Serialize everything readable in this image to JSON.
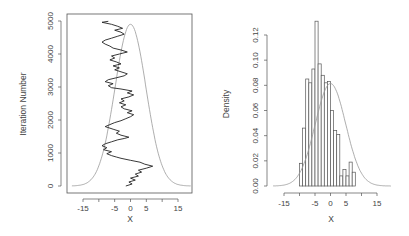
{
  "chart_data": [
    {
      "type": "line",
      "title": "",
      "xlabel": "X",
      "ylabel": "Iteration Number",
      "xlim": [
        -19,
        20
      ],
      "ylim": [
        -150,
        5150
      ],
      "x_ticks": [
        -15,
        -10,
        -5,
        0,
        5,
        10,
        15
      ],
      "x_tick_labels": [
        "-15",
        "",
        "-5",
        "0",
        "5",
        "",
        "15"
      ],
      "y_ticks": [
        0,
        1000,
        2000,
        3000,
        4000,
        5000
      ],
      "y_tick_labels": [
        "0",
        "1000",
        "2000",
        "3000",
        "4000",
        "5000"
      ],
      "grid": false,
      "series": [
        {
          "name": "trace",
          "color": "#222222",
          "points": [
            [
              -1.5,
              0
            ],
            [
              0.5,
              60
            ],
            [
              -0.5,
              120
            ],
            [
              1.5,
              180
            ],
            [
              0,
              240
            ],
            [
              2.5,
              300
            ],
            [
              1.5,
              360
            ],
            [
              3.5,
              420
            ],
            [
              2.5,
              480
            ],
            [
              5,
              540
            ],
            [
              7,
              600
            ],
            [
              4.5,
              660
            ],
            [
              3,
              720
            ],
            [
              0,
              780
            ],
            [
              -3,
              840
            ],
            [
              -4.5,
              880
            ],
            [
              -6,
              920
            ],
            [
              -7.5,
              980
            ],
            [
              -6,
              1040
            ],
            [
              -8.5,
              1100
            ],
            [
              -7.5,
              1160
            ],
            [
              -9,
              1220
            ],
            [
              -8,
              1280
            ],
            [
              -6,
              1340
            ],
            [
              -4,
              1400
            ],
            [
              -2,
              1440
            ],
            [
              -0.5,
              1480
            ],
            [
              -3,
              1540
            ],
            [
              -4.5,
              1600
            ],
            [
              -3.5,
              1660
            ],
            [
              -5.5,
              1720
            ],
            [
              -8,
              1800
            ],
            [
              -6.5,
              1860
            ],
            [
              -5,
              1920
            ],
            [
              -3,
              1980
            ],
            [
              -1.5,
              2040
            ],
            [
              0,
              2100
            ],
            [
              1,
              2160
            ],
            [
              -1,
              2220
            ],
            [
              0.5,
              2280
            ],
            [
              -2,
              2340
            ],
            [
              -3,
              2400
            ],
            [
              -1.5,
              2460
            ],
            [
              -3.5,
              2520
            ],
            [
              -2,
              2580
            ],
            [
              -3,
              2640
            ],
            [
              -0.5,
              2700
            ],
            [
              1,
              2760
            ],
            [
              -1,
              2820
            ],
            [
              0.5,
              2880
            ],
            [
              -3,
              2940
            ],
            [
              -6,
              2980
            ],
            [
              -7,
              3040
            ],
            [
              -5.5,
              3100
            ],
            [
              -8,
              3160
            ],
            [
              -7,
              3220
            ],
            [
              -4.5,
              3280
            ],
            [
              -2,
              3340
            ],
            [
              -1,
              3400
            ],
            [
              -3,
              3460
            ],
            [
              -5,
              3520
            ],
            [
              -3.5,
              3580
            ],
            [
              -5.5,
              3640
            ],
            [
              -3,
              3700
            ],
            [
              -4.5,
              3760
            ],
            [
              -6.5,
              3820
            ],
            [
              -5,
              3880
            ],
            [
              -6,
              3940
            ],
            [
              -3.5,
              4000
            ],
            [
              -1,
              4060
            ],
            [
              -3,
              4120
            ],
            [
              -5.5,
              4180
            ],
            [
              -6.5,
              4240
            ],
            [
              -8,
              4300
            ],
            [
              -9,
              4360
            ],
            [
              -8,
              4420
            ],
            [
              -6,
              4480
            ],
            [
              -4,
              4540
            ],
            [
              -2,
              4600
            ],
            [
              -3,
              4660
            ],
            [
              -5,
              4720
            ],
            [
              -2.5,
              4780
            ],
            [
              -4,
              4840
            ],
            [
              -6,
              4900
            ],
            [
              -9,
              4960
            ],
            [
              -7,
              4990
            ]
          ]
        },
        {
          "name": "normal density curve",
          "color": "#999999",
          "mean": 0,
          "sd": 4.9,
          "peak_iteration": 4900
        }
      ]
    },
    {
      "type": "bar",
      "title": "",
      "xlabel": "X",
      "ylabel": "Density",
      "xlim": [
        -19,
        20
      ],
      "ylim": [
        0,
        0.125
      ],
      "x_ticks": [
        -15,
        -10,
        -5,
        0,
        5,
        10,
        15
      ],
      "x_tick_labels": [
        "-15",
        "",
        "-5",
        "0",
        "5",
        "",
        "15"
      ],
      "y_ticks": [
        0.0,
        0.02,
        0.04,
        0.06,
        0.08,
        0.1,
        0.12
      ],
      "y_tick_labels": [
        "0.00",
        "0.02",
        "0.04",
        "0.06",
        "0.08",
        "0.10",
        "0.12"
      ],
      "grid": false,
      "bin_width": 1,
      "bin_starts": [
        -10,
        -9,
        -8,
        -7,
        -6,
        -5,
        -4,
        -3,
        -2,
        -1,
        0,
        1,
        2,
        3,
        4,
        5,
        6,
        7
      ],
      "values": [
        0.018,
        0.046,
        0.085,
        0.082,
        0.093,
        0.131,
        0.097,
        0.088,
        0.082,
        0.083,
        0.06,
        0.044,
        0.041,
        0.008,
        0.013,
        0.008,
        0.019,
        0.011
      ],
      "overlay": {
        "name": "normal density curve",
        "mean": 0,
        "sd": 4.9,
        "color": "#999999"
      }
    }
  ],
  "colors": {
    "axis": "#555555",
    "trace": "#222222",
    "curve": "#999999",
    "bar_edge": "#555555"
  }
}
